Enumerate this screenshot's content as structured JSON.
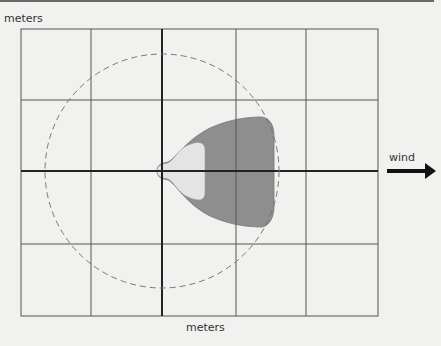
{
  "diagram": {
    "y_axis_label": "meters",
    "x_axis_label": "meters",
    "wind_label": "wind",
    "grid": {
      "columns": 5,
      "rows": 4
    },
    "colors": {
      "background": "#f1f1ef",
      "grid_line": "#555555",
      "axis_line": "#222222",
      "plume_dark": "#8e8e8e",
      "plume_light": "#e2e2e2",
      "circle": "#777777",
      "arrow": "#111111"
    },
    "elements": [
      "dashed-circle (threat radius)",
      "dark gray plume zone",
      "light gray inner zone",
      "wind direction arrow pointing right"
    ]
  }
}
